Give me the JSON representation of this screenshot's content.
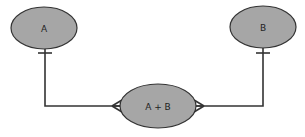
{
  "diagram": {
    "type": "entity-relationship",
    "entities": [
      {
        "id": "A",
        "label": "A"
      },
      {
        "id": "B",
        "label": "B"
      },
      {
        "id": "AB",
        "label": "A + B"
      }
    ],
    "relationships": [
      {
        "from": "A",
        "to": "AB",
        "from_cardinality": "one",
        "to_cardinality": "many"
      },
      {
        "from": "B",
        "to": "AB",
        "from_cardinality": "one",
        "to_cardinality": "many"
      }
    ],
    "colors": {
      "entity_fill": "#a6a6a6",
      "stroke": "#333333",
      "text": "#222222",
      "background": "#ffffff"
    }
  }
}
